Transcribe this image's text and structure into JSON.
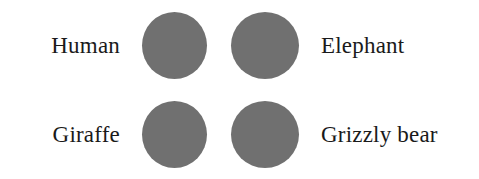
{
  "figure": {
    "background_color": "#ffffff",
    "text_color": "#1a1a1a",
    "marker_color": "#707070"
  },
  "chart_data": {
    "type": "table",
    "title": "",
    "xlabel": "",
    "ylabel": "",
    "layout": "2x2 grid of uniform gray circular markers with a text label on the outer side of each row",
    "marker_shape": "circle",
    "marker_color": "#707070",
    "marker_diameter_px": 66,
    "categories": [
      "Human",
      "Elephant",
      "Giraffe",
      "Grizzly bear"
    ],
    "rows": [
      {
        "left_label": "Human",
        "left_marker": "circle",
        "right_marker": "circle",
        "right_label": "Elephant"
      },
      {
        "left_label": "Giraffe",
        "left_marker": "circle",
        "right_marker": "circle",
        "right_label": "Grizzly bear"
      }
    ],
    "values": [
      1,
      1,
      1,
      1
    ],
    "legend": [],
    "annotations": []
  },
  "labels": {
    "row1_left": "Human",
    "row1_right": "Elephant",
    "row2_left": "Giraffe",
    "row2_right": "Grizzly bear"
  },
  "markers": {
    "row1_left_name": "circle-marker-human",
    "row1_right_name": "circle-marker-elephant",
    "row2_left_name": "circle-marker-giraffe",
    "row2_right_name": "circle-marker-grizzly-bear"
  }
}
